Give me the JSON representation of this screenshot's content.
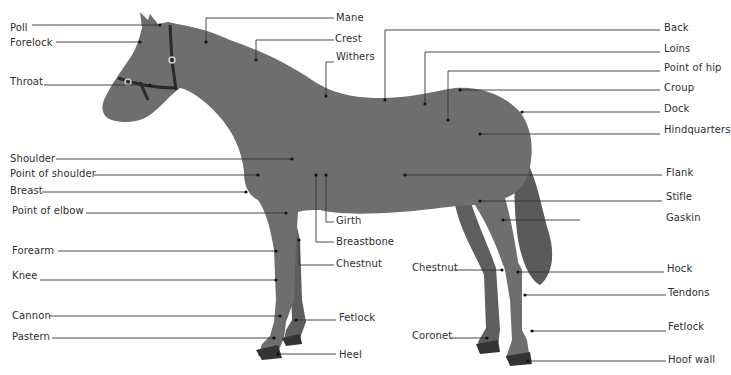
{
  "diagram": {
    "colors": {
      "horse_body": "#6e6e6e",
      "horse_dark": "#555555",
      "line": "#333333",
      "label_text": "#2e2e2e",
      "background": "#ffffff"
    },
    "labels_left": [
      {
        "id": "poll",
        "text": "Poll",
        "x": 10,
        "y": 22
      },
      {
        "id": "forelock",
        "text": "Forelock",
        "x": 10,
        "y": 37
      },
      {
        "id": "throat",
        "text": "Throat",
        "x": 10,
        "y": 76
      },
      {
        "id": "shoulder",
        "text": "Shoulder",
        "x": 10,
        "y": 153
      },
      {
        "id": "point-of-shoulder",
        "text": "Point of shoulder",
        "x": 10,
        "y": 168
      },
      {
        "id": "breast",
        "text": "Breast",
        "x": 10,
        "y": 185
      },
      {
        "id": "point-of-elbow",
        "text": "Point of elbow",
        "x": 12,
        "y": 205
      },
      {
        "id": "forearm",
        "text": "Forearm",
        "x": 12,
        "y": 245
      },
      {
        "id": "knee",
        "text": "Knee",
        "x": 12,
        "y": 270
      },
      {
        "id": "cannon",
        "text": "Cannon",
        "x": 12,
        "y": 310
      },
      {
        "id": "pastern",
        "text": "Pastern",
        "x": 12,
        "y": 331
      }
    ],
    "labels_middle": [
      {
        "id": "mane",
        "text": "Mane",
        "x": 336,
        "y": 11
      },
      {
        "id": "crest",
        "text": "Crest",
        "x": 335,
        "y": 32
      },
      {
        "id": "withers",
        "text": "Withers",
        "x": 336,
        "y": 51
      },
      {
        "id": "girth",
        "text": "Girth",
        "x": 336,
        "y": 214
      },
      {
        "id": "breastbone",
        "text": "Breastbone",
        "x": 336,
        "y": 236
      },
      {
        "id": "chestnut-fore",
        "text": "Chestnut",
        "x": 336,
        "y": 257
      },
      {
        "id": "fetlock-fore",
        "text": "Fetlock",
        "x": 339,
        "y": 311
      },
      {
        "id": "heel",
        "text": "Heel",
        "x": 339,
        "y": 348
      },
      {
        "id": "chestnut-hind",
        "text": "Chestnut",
        "x": 412,
        "y": 262
      },
      {
        "id": "coronet",
        "text": "Coronet",
        "x": 412,
        "y": 329
      }
    ],
    "labels_right": [
      {
        "id": "back",
        "text": "Back",
        "x": 664,
        "y": 21
      },
      {
        "id": "loins",
        "text": "Loins",
        "x": 664,
        "y": 42
      },
      {
        "id": "point-of-hip",
        "text": "Point of hip",
        "x": 664,
        "y": 62
      },
      {
        "id": "croup",
        "text": "Croup",
        "x": 664,
        "y": 82
      },
      {
        "id": "dock",
        "text": "Dock",
        "x": 664,
        "y": 103
      },
      {
        "id": "hindquarters",
        "text": "Hindquarters",
        "x": 664,
        "y": 124
      },
      {
        "id": "flank",
        "text": "Flank",
        "x": 666,
        "y": 167
      },
      {
        "id": "stifle",
        "text": "Stifle",
        "x": 666,
        "y": 191
      },
      {
        "id": "gaskin",
        "text": "Gaskin",
        "x": 666,
        "y": 212
      },
      {
        "id": "hock",
        "text": "Hock",
        "x": 667,
        "y": 263
      },
      {
        "id": "tendons",
        "text": "Tendons",
        "x": 668,
        "y": 287
      },
      {
        "id": "fetlock-hind",
        "text": "Fetlock",
        "x": 668,
        "y": 321
      },
      {
        "id": "hoof-wall",
        "text": "Hoof wall",
        "x": 668,
        "y": 354
      }
    ]
  }
}
